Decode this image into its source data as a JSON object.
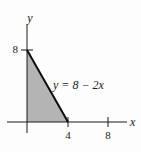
{
  "figure": {
    "equation_label": "y = 8 − 2x",
    "axis_labels": {
      "x": "x",
      "y": "y"
    },
    "x_ticks": [
      {
        "value": 4,
        "label": "4"
      },
      {
        "value": 8,
        "label": "8"
      }
    ],
    "y_ticks": [
      {
        "value": 8,
        "label": "8"
      }
    ],
    "line": {
      "slope": -2,
      "y_intercept": 8,
      "x_intercept": 4
    },
    "shaded_region": {
      "description": "triangle bounded by x-axis, y-axis and line y = 8 - 2x",
      "vertices": [
        [
          0,
          0
        ],
        [
          0,
          8
        ],
        [
          4,
          0
        ]
      ]
    },
    "colors": {
      "background": "#fdfdfd",
      "axis": "#1a1a1a",
      "boundary_line": "#0d0d0d",
      "region_fill": "#b4b4b4"
    }
  }
}
